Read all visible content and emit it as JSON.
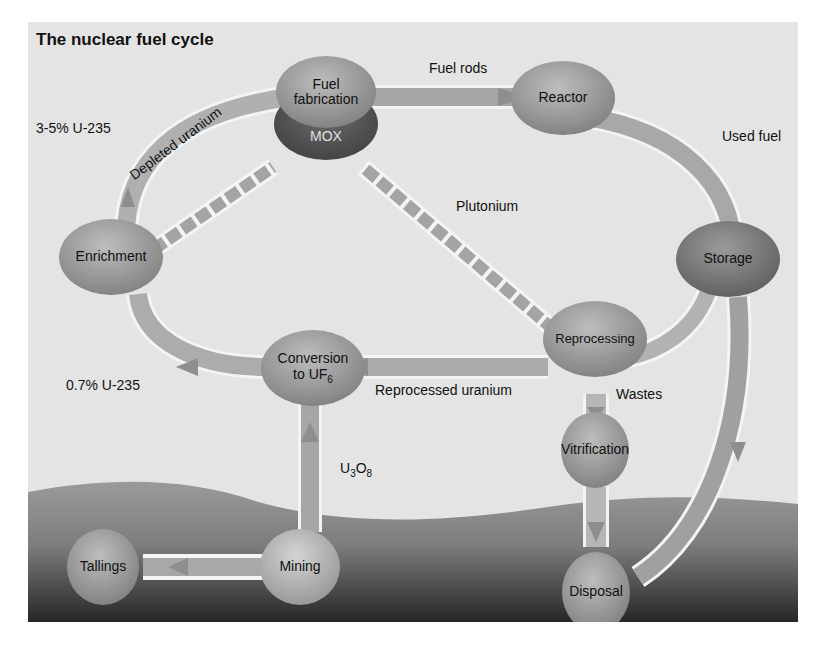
{
  "title": "The nuclear fuel cycle",
  "nodes": {
    "fuel_fabrication": "Fuel fabrication",
    "fuel_fabrication_line1": "Fuel",
    "fuel_fabrication_line2": "fabrication",
    "mox": "MOX",
    "reactor": "Reactor",
    "storage": "Storage",
    "enrichment": "Enrichment",
    "conversion_line1": "Conversion",
    "conversion_line2": "to UF",
    "conversion_sub": "6",
    "reprocessing": "Reprocessing",
    "vitrification": "Vitrification",
    "tailings": "Tallings",
    "mining": "Mining",
    "disposal": "Disposal"
  },
  "flows": {
    "fuel_rods": "Fuel rods",
    "used_fuel": "Used fuel",
    "enriched": "3-5% U-235",
    "depleted_uranium": "Depleted uranium",
    "plutonium": "Plutonium",
    "natural": "0.7% U-235",
    "reprocessed_uranium": "Reprocessed uranium",
    "wastes": "Wastes",
    "u3o8_u": "U",
    "u3o8_3": "3",
    "u3o8_o": "O",
    "u3o8_8": "8"
  },
  "colors": {
    "background": "#e4e4e4",
    "node": "#9a9a9a",
    "node_dark": "#6e6e6e",
    "mox": "#555555",
    "arrow": "#a8a8a8",
    "ground_top": "#8c8c8c",
    "ground_bottom": "#2a2a2a"
  }
}
